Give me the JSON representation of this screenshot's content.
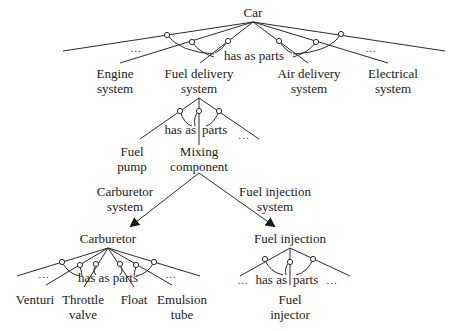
{
  "diagram": {
    "root": {
      "label": "Car"
    },
    "relation_label": "has as parts",
    "ellipsis": "...",
    "level1": [
      {
        "line1": "Engine",
        "line2": "system"
      },
      {
        "line1": "Fuel delivery",
        "line2": "system"
      },
      {
        "line1": "Air delivery",
        "line2": "system"
      },
      {
        "line1": "Electrical",
        "line2": "system"
      }
    ],
    "fuel_delivery_parts": {
      "relation_left": "has as",
      "relation_right": "parts",
      "children": [
        {
          "line1": "Fuel",
          "line2": "pump"
        },
        {
          "line1": "Mixing",
          "line2": "component"
        }
      ]
    },
    "mixing_variants": [
      {
        "edge_line1": "Carburetor",
        "edge_line2": "system",
        "target": "Carburetor"
      },
      {
        "edge_line1": "Fuel injection",
        "edge_line2": "system",
        "target": "Fuel injection"
      }
    ],
    "carburetor_parts": {
      "relation": "has as parts",
      "children": [
        {
          "line1": "Venturi",
          "line2": ""
        },
        {
          "line1": "Throttle",
          "line2": "valve"
        },
        {
          "line1": "Float",
          "line2": ""
        },
        {
          "line1": "Emulsion",
          "line2": "tube"
        }
      ]
    },
    "fuel_injection_parts": {
      "relation_left": "has as",
      "relation_right": "parts",
      "children": [
        {
          "line1": "Fuel",
          "line2": "injector"
        }
      ]
    }
  }
}
